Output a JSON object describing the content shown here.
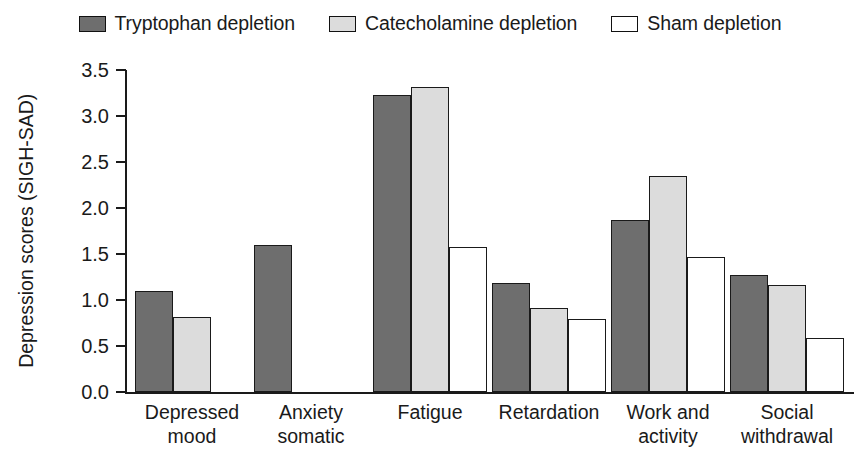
{
  "chart_data": {
    "type": "bar",
    "title": "",
    "xlabel": "",
    "ylabel": "Depression scores (SIGH-SAD)",
    "ylim": [
      0.0,
      3.5
    ],
    "ytick_labels": [
      "0.0",
      "0.5",
      "1.0",
      "1.5",
      "2.0",
      "2.5",
      "3.0",
      "3.5"
    ],
    "ytick_values": [
      0.0,
      0.5,
      1.0,
      1.5,
      2.0,
      2.5,
      3.0,
      3.5
    ],
    "grid": false,
    "legend_position": "top-center",
    "categories": [
      "Depressed mood",
      "Anxiety somatic",
      "Fatigue",
      "Retardation",
      "Work and activity",
      "Social withdrawal"
    ],
    "category_lines": [
      [
        "Depressed",
        "mood"
      ],
      [
        "Anxiety",
        "somatic"
      ],
      [
        "Fatigue",
        ""
      ],
      [
        "Retardation",
        ""
      ],
      [
        "Work and",
        "activity"
      ],
      [
        "Social",
        "withdrawal"
      ]
    ],
    "series": [
      {
        "name": "Tryptophan depletion",
        "color": "#6e6e6e",
        "values": [
          1.1,
          1.6,
          3.23,
          1.19,
          1.87,
          1.27
        ]
      },
      {
        "name": "Catecholamine depletion",
        "color": "#dcdcdc",
        "values": [
          0.81,
          null,
          3.32,
          0.91,
          2.35,
          1.16
        ]
      },
      {
        "name": "Sham depletion",
        "color": "#ffffff",
        "values": [
          null,
          null,
          1.58,
          0.79,
          1.47,
          0.59
        ]
      }
    ]
  },
  "legend": {
    "entries": [
      {
        "label": "Tryptophan depletion",
        "swatch": "dark-gray-swatch"
      },
      {
        "label": "Catecholamine depletion",
        "swatch": "light-gray-swatch"
      },
      {
        "label": "Sham depletion",
        "swatch": "white-swatch"
      }
    ]
  }
}
